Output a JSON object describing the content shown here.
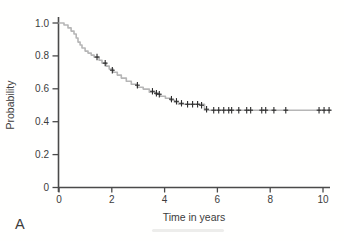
{
  "figure": {
    "panel_label": "A"
  },
  "colors": {
    "background": "#fffffe",
    "axis": "#4a4a4a",
    "text": "#3c3c3c",
    "curve": "#b6b6b6",
    "censor": "#2c2c2c"
  },
  "chart_data": {
    "type": "line",
    "subtype": "kaplan-meier-step-curve",
    "title": "",
    "xlabel": "Time in years",
    "ylabel": "Probability",
    "xlim": [
      0,
      10
    ],
    "ylim": [
      0,
      1.0
    ],
    "xticks": [
      0,
      2,
      4,
      6,
      8,
      10
    ],
    "xtick_labels": [
      "0",
      "2",
      "4",
      "6",
      "8",
      "10"
    ],
    "yticks": [
      0,
      0.2,
      0.4,
      0.6,
      0.8,
      1.0
    ],
    "ytick_labels": [
      "0",
      "0.2",
      "0.4",
      "0.6",
      "0.8",
      "1.0"
    ],
    "grid": false,
    "legend": "none",
    "series": [
      {
        "name": "survival-probability",
        "style": "step",
        "points": [
          [
            0.0,
            1.0
          ],
          [
            0.19,
            1.0
          ],
          [
            0.19,
            0.988
          ],
          [
            0.34,
            0.988
          ],
          [
            0.34,
            0.97
          ],
          [
            0.46,
            0.97
          ],
          [
            0.46,
            0.951
          ],
          [
            0.57,
            0.951
          ],
          [
            0.57,
            0.933
          ],
          [
            0.65,
            0.933
          ],
          [
            0.65,
            0.909
          ],
          [
            0.72,
            0.909
          ],
          [
            0.72,
            0.884
          ],
          [
            0.8,
            0.884
          ],
          [
            0.8,
            0.866
          ],
          [
            0.87,
            0.866
          ],
          [
            0.87,
            0.848
          ],
          [
            0.99,
            0.848
          ],
          [
            0.99,
            0.829
          ],
          [
            1.1,
            0.829
          ],
          [
            1.1,
            0.817
          ],
          [
            1.22,
            0.817
          ],
          [
            1.22,
            0.805
          ],
          [
            1.33,
            0.805
          ],
          [
            1.33,
            0.793
          ],
          [
            1.52,
            0.793
          ],
          [
            1.52,
            0.774
          ],
          [
            1.63,
            0.774
          ],
          [
            1.63,
            0.756
          ],
          [
            1.79,
            0.756
          ],
          [
            1.79,
            0.738
          ],
          [
            1.9,
            0.738
          ],
          [
            1.9,
            0.72
          ],
          [
            2.05,
            0.72
          ],
          [
            2.05,
            0.701
          ],
          [
            2.21,
            0.701
          ],
          [
            2.21,
            0.683
          ],
          [
            2.36,
            0.683
          ],
          [
            2.36,
            0.665
          ],
          [
            2.55,
            0.665
          ],
          [
            2.55,
            0.646
          ],
          [
            2.74,
            0.646
          ],
          [
            2.74,
            0.628
          ],
          [
            2.97,
            0.628
          ],
          [
            2.97,
            0.61
          ],
          [
            3.19,
            0.61
          ],
          [
            3.19,
            0.598
          ],
          [
            3.42,
            0.598
          ],
          [
            3.42,
            0.579
          ],
          [
            3.65,
            0.579
          ],
          [
            3.65,
            0.567
          ],
          [
            3.84,
            0.567
          ],
          [
            3.84,
            0.555
          ],
          [
            4.03,
            0.555
          ],
          [
            4.03,
            0.543
          ],
          [
            4.22,
            0.543
          ],
          [
            4.22,
            0.53
          ],
          [
            4.37,
            0.53
          ],
          [
            4.37,
            0.518
          ],
          [
            4.52,
            0.518
          ],
          [
            4.52,
            0.506
          ],
          [
            5.51,
            0.506
          ],
          [
            5.51,
            0.47
          ],
          [
            10.3,
            0.47
          ]
        ]
      }
    ],
    "censor_marks": {
      "symbol": "+",
      "points": [
        [
          1.44,
          0.793
        ],
        [
          1.75,
          0.756
        ],
        [
          2.02,
          0.713
        ],
        [
          2.97,
          0.622
        ],
        [
          3.54,
          0.585
        ],
        [
          3.69,
          0.573
        ],
        [
          3.8,
          0.567
        ],
        [
          4.26,
          0.537
        ],
        [
          4.45,
          0.524
        ],
        [
          4.64,
          0.512
        ],
        [
          4.87,
          0.506
        ],
        [
          5.06,
          0.506
        ],
        [
          5.25,
          0.506
        ],
        [
          5.4,
          0.5
        ],
        [
          5.59,
          0.476
        ],
        [
          5.86,
          0.47
        ],
        [
          6.05,
          0.47
        ],
        [
          6.24,
          0.47
        ],
        [
          6.43,
          0.47
        ],
        [
          6.54,
          0.47
        ],
        [
          6.81,
          0.47
        ],
        [
          7.11,
          0.47
        ],
        [
          7.26,
          0.47
        ],
        [
          7.68,
          0.47
        ],
        [
          7.83,
          0.47
        ],
        [
          8.14,
          0.47
        ],
        [
          8.59,
          0.47
        ],
        [
          9.85,
          0.47
        ],
        [
          10.04,
          0.47
        ],
        [
          10.23,
          0.47
        ]
      ]
    }
  }
}
